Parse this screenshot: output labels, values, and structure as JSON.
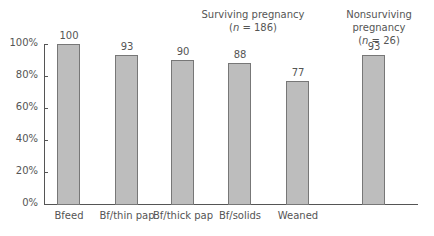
{
  "chart_data": {
    "type": "bar",
    "title": "",
    "xlabel": "",
    "ylabel": "",
    "ylim": [
      0,
      100
    ],
    "ytick_labels": [
      "0%",
      "20%",
      "40%",
      "60%",
      "80%",
      "100%"
    ],
    "grid": false,
    "categories": [
      "Bfeed",
      "Bf/thin pap",
      "Bf/thick pap",
      "Bf/solids",
      "Weaned",
      ""
    ],
    "values": [
      100,
      93,
      90,
      88,
      77,
      93
    ],
    "value_labels": [
      "100",
      "93",
      "90",
      "88",
      "77",
      "93"
    ],
    "groups": [
      {
        "name": "Surviving pregnancy",
        "n_label_prefix": "(",
        "n_italic": "n",
        "n_label_suffix": " = 186)",
        "categories": [
          "Bfeed",
          "Bf/thin pap",
          "Bf/thick pap",
          "Bf/solids",
          "Weaned"
        ]
      },
      {
        "name": "Nonsurviving pregnancy",
        "n_label_prefix": "(",
        "n_italic": "n",
        "n_label_suffix": " = 26)",
        "categories": [
          ""
        ]
      }
    ],
    "bar_color": "#bdbdbd",
    "bar_edge_color": "#777777"
  }
}
